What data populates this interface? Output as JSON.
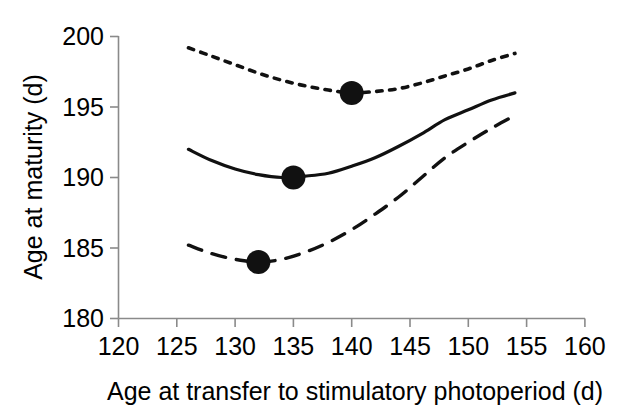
{
  "chart_data": {
    "type": "line",
    "title": "",
    "xlabel": "Age at transfer to stimulatory photoperiod (d)",
    "ylabel": "Age at maturity (d)",
    "xlim": [
      120,
      160
    ],
    "ylim": [
      180,
      200
    ],
    "xticks": [
      120,
      125,
      130,
      135,
      140,
      145,
      150,
      155,
      160
    ],
    "yticks": [
      180,
      185,
      190,
      195,
      200
    ],
    "xtick_labels": [
      "120",
      "125",
      "130",
      "135",
      "140",
      "145",
      "150",
      "155",
      "160"
    ],
    "ytick_labels": [
      "180",
      "185",
      "190",
      "195",
      "200"
    ],
    "grid": false,
    "legend": "none",
    "line_color": "#111111",
    "axis_color": "#8a8a8a",
    "series": [
      {
        "name": "dotted-curve",
        "style": "dotted",
        "x": [
          126,
          128,
          130,
          132,
          134,
          136,
          138,
          140,
          142,
          144,
          146,
          148,
          150,
          152,
          154
        ],
        "values": [
          199.2,
          198.6,
          198.0,
          197.4,
          196.9,
          196.5,
          196.2,
          196.0,
          196.1,
          196.3,
          196.7,
          197.2,
          197.7,
          198.3,
          198.8
        ],
        "vertex": {
          "x": 140,
          "y": 196.0
        },
        "marker": {
          "x": 140,
          "y": 196,
          "shape": "filled-circle"
        }
      },
      {
        "name": "solid-curve",
        "style": "solid",
        "x": [
          126,
          128,
          130,
          132,
          134,
          136,
          138,
          140,
          142,
          144,
          146,
          148,
          150,
          152,
          154
        ],
        "values": [
          192.0,
          191.2,
          190.6,
          190.2,
          190.0,
          190.1,
          190.3,
          190.8,
          191.4,
          192.2,
          193.1,
          194.1,
          194.8,
          195.5,
          196.0
        ],
        "vertex": {
          "x": 135,
          "y": 190.0
        },
        "marker": {
          "x": 135,
          "y": 190,
          "shape": "filled-circle"
        }
      },
      {
        "name": "dashed-curve",
        "style": "dashed",
        "x": [
          126,
          128,
          130,
          132,
          134,
          136,
          138,
          140,
          142,
          144,
          146,
          148,
          150,
          152,
          154
        ],
        "values": [
          185.2,
          184.6,
          184.2,
          184.0,
          184.2,
          184.7,
          185.4,
          186.3,
          187.4,
          188.6,
          190.0,
          191.4,
          192.5,
          193.5,
          194.4
        ],
        "vertex": {
          "x": 132,
          "y": 184.0
        },
        "marker": {
          "x": 132,
          "y": 184,
          "shape": "filled-circle"
        }
      }
    ],
    "markers": [
      {
        "series": "dotted-curve",
        "x": 140,
        "y": 196
      },
      {
        "series": "solid-curve",
        "x": 135,
        "y": 190
      },
      {
        "series": "dashed-curve",
        "x": 132,
        "y": 184
      }
    ]
  }
}
